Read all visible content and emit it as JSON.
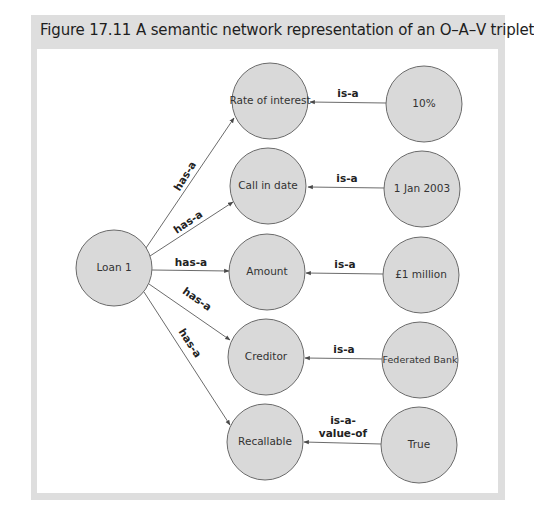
{
  "figure": {
    "number": "Figure 17.11",
    "caption": "A semantic network representation of an O–A–V triplet"
  },
  "colors": {
    "frame": "#dedede",
    "node_fill": "#d9d9d9",
    "node_stroke": "#6a6a6a",
    "edge": "#5a5a5a"
  },
  "nodes": {
    "object": {
      "label": "Loan 1"
    },
    "attributes": [
      {
        "label": "Rate of interest"
      },
      {
        "label": "Call in date"
      },
      {
        "label": "Amount"
      },
      {
        "label": "Creditor"
      },
      {
        "label": "Recallable"
      }
    ],
    "values": [
      {
        "label": "10%"
      },
      {
        "label": "1 Jan 2003"
      },
      {
        "label": "£1 million"
      },
      {
        "label": "Federated Bank"
      },
      {
        "label": "True"
      }
    ]
  },
  "edges": {
    "has_a": [
      {
        "label": "has-a",
        "from": "Loan 1",
        "to": "Rate of interest"
      },
      {
        "label": "has-a",
        "from": "Loan 1",
        "to": "Call in date"
      },
      {
        "label": "has-a",
        "from": "Loan 1",
        "to": "Amount"
      },
      {
        "label": "has-a",
        "from": "Loan 1",
        "to": "Creditor"
      },
      {
        "label": "has-a",
        "from": "Loan 1",
        "to": "Recallable"
      }
    ],
    "value_links": [
      {
        "label": "is-a",
        "from": "10%",
        "to": "Rate of interest"
      },
      {
        "label": "is-a",
        "from": "1 Jan 2003",
        "to": "Call in date"
      },
      {
        "label": "is-a",
        "from": "£1 million",
        "to": "Amount"
      },
      {
        "label": "is-a",
        "from": "Federated Bank",
        "to": "Creditor"
      },
      {
        "label_line1": "is-a-",
        "label_line2": "value-of",
        "from": "True",
        "to": "Recallable"
      }
    ]
  }
}
